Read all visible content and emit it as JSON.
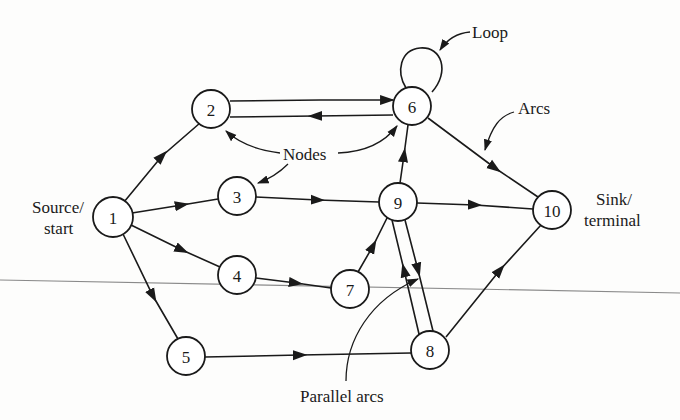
{
  "diagram": {
    "type": "directed-network-graph",
    "nodes": [
      {
        "id": "1",
        "label": "1",
        "x": 113,
        "y": 217
      },
      {
        "id": "2",
        "label": "2",
        "x": 211,
        "y": 109
      },
      {
        "id": "3",
        "label": "3",
        "x": 237,
        "y": 196
      },
      {
        "id": "4",
        "label": "4",
        "x": 237,
        "y": 275
      },
      {
        "id": "5",
        "label": "5",
        "x": 186,
        "y": 356
      },
      {
        "id": "6",
        "label": "6",
        "x": 412,
        "y": 106
      },
      {
        "id": "7",
        "label": "7",
        "x": 350,
        "y": 289
      },
      {
        "id": "8",
        "label": "8",
        "x": 430,
        "y": 350
      },
      {
        "id": "9",
        "label": "9",
        "x": 398,
        "y": 202
      },
      {
        "id": "10",
        "label": "10",
        "x": 552,
        "y": 210
      }
    ],
    "arcs": [
      {
        "from": "1",
        "to": "2"
      },
      {
        "from": "1",
        "to": "3"
      },
      {
        "from": "1",
        "to": "4"
      },
      {
        "from": "1",
        "to": "5"
      },
      {
        "from": "2",
        "to": "6"
      },
      {
        "from": "6",
        "to": "2"
      },
      {
        "from": "3",
        "to": "9"
      },
      {
        "from": "4",
        "to": "7"
      },
      {
        "from": "5",
        "to": "8"
      },
      {
        "from": "7",
        "to": "9"
      },
      {
        "from": "9",
        "to": "6"
      },
      {
        "from": "9",
        "to": "10"
      },
      {
        "from": "9",
        "to": "8"
      },
      {
        "from": "8",
        "to": "9"
      },
      {
        "from": "6",
        "to": "10"
      },
      {
        "from": "8",
        "to": "10"
      },
      {
        "from": "6",
        "to": "6",
        "kind": "loop"
      }
    ],
    "annotations": {
      "source_line1": "Source/",
      "source_line2": "start",
      "sink_line1": "Sink/",
      "sink_line2": "terminal",
      "nodes": "Nodes",
      "loop": "Loop",
      "arcs": "Arcs",
      "parallel_arcs": "Parallel arcs"
    },
    "colors": {
      "ink": "#1a1a1a",
      "paper": "#fdfdfc",
      "scan_line": "#8a8a8a"
    }
  }
}
